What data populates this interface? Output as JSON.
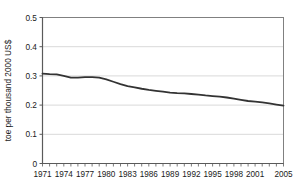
{
  "chart_data": {
    "type": "line",
    "title": "",
    "xlabel": "",
    "ylabel": "toe per thousand 2000 US$",
    "ylim": [
      0,
      0.5
    ],
    "yticks": [
      "0",
      "0.1",
      "0.2",
      "0.3",
      "0.4",
      "0.5"
    ],
    "ytick_values": [
      0,
      0.1,
      0.2,
      0.3,
      0.4,
      0.5
    ],
    "xlim": [
      1971,
      2005
    ],
    "xticks": [
      "1971",
      "1974",
      "1977",
      "1980",
      "1983",
      "1986",
      "1989",
      "1992",
      "1995",
      "1998",
      "2001",
      "2005"
    ],
    "xtick_values": [
      1971,
      1974,
      1977,
      1980,
      1983,
      1986,
      1989,
      1992,
      1995,
      1998,
      2001,
      2005
    ],
    "grid": "horizontal",
    "legend": "none",
    "line_color": "#333333",
    "x": [
      1971,
      1972,
      1973,
      1974,
      1975,
      1976,
      1977,
      1978,
      1979,
      1980,
      1981,
      1982,
      1983,
      1984,
      1985,
      1986,
      1987,
      1988,
      1989,
      1990,
      1991,
      1992,
      1993,
      1994,
      1995,
      1996,
      1997,
      1998,
      1999,
      2000,
      2001,
      2002,
      2003,
      2004,
      2005
    ],
    "values": [
      0.308,
      0.306,
      0.305,
      0.3,
      0.294,
      0.294,
      0.296,
      0.296,
      0.294,
      0.288,
      0.28,
      0.272,
      0.265,
      0.261,
      0.256,
      0.252,
      0.249,
      0.246,
      0.243,
      0.241,
      0.24,
      0.238,
      0.236,
      0.233,
      0.231,
      0.229,
      0.226,
      0.222,
      0.218,
      0.214,
      0.212,
      0.209,
      0.206,
      0.202,
      0.198
    ]
  },
  "axes": {
    "y_axis_label": "toe per thousand 2000 US$"
  }
}
